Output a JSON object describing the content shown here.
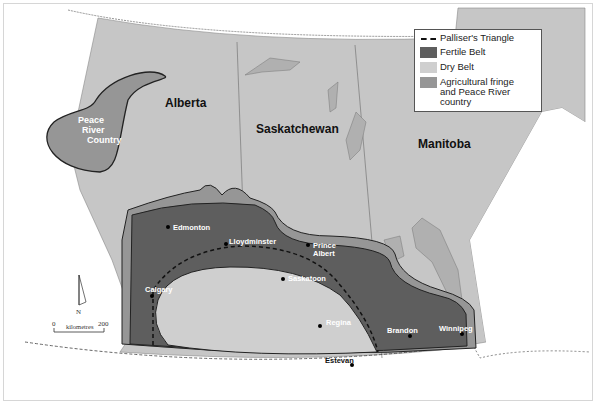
{
  "map": {
    "provinces": [
      {
        "name": "Alberta"
      },
      {
        "name": "Saskatchewan"
      },
      {
        "name": "Manitoba"
      }
    ],
    "regions": {
      "peace_river": "Peace River Country",
      "peace_river_lines": [
        "Peace",
        "River",
        "Country"
      ]
    },
    "cities": [
      {
        "name": "Edmonton"
      },
      {
        "name": "Lloydminster"
      },
      {
        "name": "Prince Albert",
        "lines": [
          "Prince",
          "Albert"
        ]
      },
      {
        "name": "Saskatoon"
      },
      {
        "name": "Calgary"
      },
      {
        "name": "Regina"
      },
      {
        "name": "Brandon"
      },
      {
        "name": "Winnipeg"
      },
      {
        "name": "Estevan"
      }
    ],
    "compass": {
      "label": "N"
    },
    "scale": {
      "start": "0",
      "end": "200",
      "unit": "kilometres"
    },
    "colors": {
      "fertile_belt": "#5e5e5e",
      "dry_belt": "#cfcfcf",
      "agricultural_fringe": "#969696",
      "province_fill": "#c6c6c6",
      "water": "#b0b0b0"
    }
  },
  "legend": {
    "items": [
      {
        "type": "dashed-line",
        "label": "Palliser's Triangle"
      },
      {
        "type": "swatch",
        "label": "Fertile Belt",
        "color": "#5e5e5e"
      },
      {
        "type": "swatch",
        "label": "Dry Belt",
        "color": "#cfcfcf"
      },
      {
        "type": "swatch",
        "label": "Agricultural fringe",
        "label2": "and Peace River country",
        "color": "#969696"
      }
    ]
  }
}
